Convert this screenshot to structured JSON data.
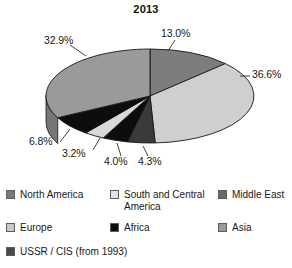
{
  "chart_data": {
    "type": "pie",
    "title": "2013",
    "subtitle": "",
    "xlabel": "",
    "ylabel": "",
    "grid": false,
    "legend_position": "bottom",
    "three_d": true,
    "value_unit": "%",
    "categories": [
      "Middle East",
      "Asia",
      "USSR / CIS (from 1993)",
      "Africa",
      "South and Central America",
      "North America",
      "Europe"
    ],
    "values": [
      13.0,
      36.6,
      4.3,
      4.0,
      3.2,
      6.8,
      32.9
    ],
    "labels": [
      "13.0%",
      "36.6%",
      "4.3%",
      "4.0%",
      "3.2%",
      "6.8%",
      "32.9%"
    ],
    "slices": [
      {
        "label": "13.0%",
        "value": 13.0,
        "color": "#7d7d7d",
        "side_color": "#5b5b5b"
      },
      {
        "label": "36.6%",
        "value": 36.6,
        "color": "#cfcfcf",
        "side_color": "#a9a9a9"
      },
      {
        "label": "4.3%",
        "value": 4.3,
        "color": "#3a3a3a",
        "side_color": "#262626"
      },
      {
        "label": "4.0%",
        "value": 4.0,
        "color": "#0d0d0d",
        "side_color": "#000000"
      },
      {
        "label": "3.2%",
        "value": 3.2,
        "color": "#d9d9d9",
        "side_color": "#b2b2b2"
      },
      {
        "label": "6.8%",
        "value": 6.8,
        "color": "#0d0d0d",
        "side_color": "#000000"
      },
      {
        "label": "32.9%",
        "value": 32.9,
        "color": "#9a9a9a",
        "side_color": "#767676"
      }
    ]
  },
  "title": "2013",
  "callouts": {
    "c1": "13.0%",
    "c2": "36.6%",
    "c3": "4.3%",
    "c4": "4.0%",
    "c5": "3.2%",
    "c6": "6.8%",
    "c7": "32.9%"
  },
  "legend": {
    "items": [
      {
        "label": "North America",
        "color": "#7a7a7a"
      },
      {
        "label": "South and Central America",
        "color": "#e4e4e4"
      },
      {
        "label": "Middle East",
        "color": "#6a6a6a"
      },
      {
        "label": "Europe",
        "color": "#c9c9c9"
      },
      {
        "label": "Africa",
        "color": "#0d0d0d"
      },
      {
        "label": "Asia",
        "color": "#9a9a9a"
      },
      {
        "label": "USSR / CIS (from 1993)",
        "color": "#4a4a4a"
      }
    ]
  }
}
